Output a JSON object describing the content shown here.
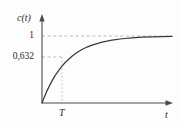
{
  "figure": {
    "name": "step-response-first-order-system",
    "background_color": "#fdfdfd",
    "curve_color": "#3a3a3a",
    "axis_color": "#4a4a4a",
    "guide_color": "#a9a9a9",
    "text_color": "#2b2b2b"
  },
  "labels": {
    "yaxis": "c(t)",
    "xaxis": "t",
    "tick_one": "1",
    "tick_tau": "0,632",
    "tick_T": "T"
  },
  "chart_data": {
    "type": "line",
    "title": "",
    "subtitle": "",
    "xlabel": "t",
    "ylabel": "c(t)",
    "xlim": [
      0,
      5.2
    ],
    "ylim": [
      0,
      1.18
    ],
    "grid": false,
    "legend": null,
    "legend_position": "none",
    "xticks": [
      1
    ],
    "xticklabels": [
      "T"
    ],
    "yticks": [
      0.632,
      1
    ],
    "yticklabels": [
      "0,632",
      "1"
    ],
    "annotations": [
      {
        "name": "steady-state-guide",
        "type": "horizontal-dashed-line",
        "y": 1,
        "x_from": 0,
        "x_to": 5.2
      },
      {
        "name": "time-constant-guide",
        "type": "horizontal-dashed-line",
        "y": 0.632,
        "x_from": 0,
        "x_to": 1
      },
      {
        "name": "time-constant-vertical-guide",
        "type": "vertical-dotted-line",
        "x": 1,
        "y_from": 0,
        "y_to": 0.632
      }
    ],
    "series": [
      {
        "name": "step response 1 - exp(-t/T)",
        "x": [
          0,
          0.1,
          0.2,
          0.3,
          0.4,
          0.5,
          0.6,
          0.7,
          0.8,
          0.9,
          1.0,
          1.2,
          1.4,
          1.6,
          1.8,
          2.0,
          2.4,
          2.8,
          3.2,
          3.6,
          4.0,
          4.4,
          4.8,
          5.2
        ],
        "y": [
          0,
          0.095,
          0.181,
          0.259,
          0.33,
          0.393,
          0.451,
          0.503,
          0.551,
          0.593,
          0.632,
          0.699,
          0.753,
          0.798,
          0.835,
          0.865,
          0.909,
          0.939,
          0.959,
          0.973,
          0.982,
          0.988,
          0.992,
          0.994
        ]
      }
    ]
  }
}
